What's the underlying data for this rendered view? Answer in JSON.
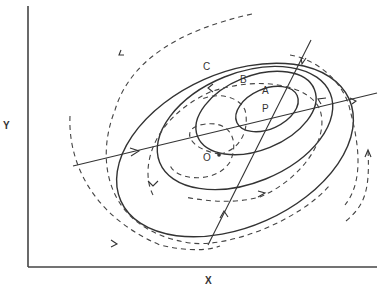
{
  "diagram": {
    "type": "phase-plane diagram",
    "axes": {
      "x_label": "X",
      "y_label": "Y"
    },
    "curves": [
      {
        "label": "A",
        "kind": "solid closed contour (innermost, around P)"
      },
      {
        "label": "B",
        "kind": "solid closed contour (middle)"
      },
      {
        "label": "C",
        "kind": "solid closed contour (outer)"
      }
    ],
    "points": [
      {
        "label": "P",
        "description": "center of innermost ellipse"
      },
      {
        "label": "O",
        "description": "origin of dashed spiral trajectory"
      }
    ],
    "lines": [
      {
        "kind": "solid straight line, shallow slope through P (major axis)"
      },
      {
        "kind": "solid straight line, steep slope through P"
      }
    ],
    "trajectories": {
      "kind": "dashed spiral with arrowheads",
      "count": 5
    }
  }
}
